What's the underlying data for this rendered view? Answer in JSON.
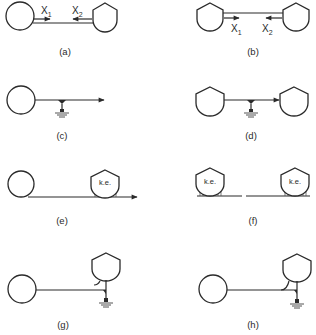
{
  "figure": {
    "panels": [
      {
        "id": "a",
        "caption": "(a)",
        "labels": {
          "x1": "X",
          "x1_sub": "1",
          "x2": "X",
          "x2_sub": "2"
        }
      },
      {
        "id": "b",
        "caption": "(b)",
        "labels": {
          "x1": "X",
          "x1_sub": "1",
          "x2": "X",
          "x2_sub": "2"
        }
      },
      {
        "id": "c",
        "caption": "(c)"
      },
      {
        "id": "d",
        "caption": "(d)"
      },
      {
        "id": "e",
        "caption": "(e)",
        "labels": {
          "ke": "k.e."
        }
      },
      {
        "id": "f",
        "caption": "(f)",
        "labels": {
          "ke_left": "k.e.",
          "ke_right": "k.e."
        }
      },
      {
        "id": "g",
        "caption": "(g)"
      },
      {
        "id": "h",
        "caption": "(h)"
      }
    ],
    "colors": {
      "ink": "#2a2a2a",
      "background": "#ffffff"
    }
  }
}
